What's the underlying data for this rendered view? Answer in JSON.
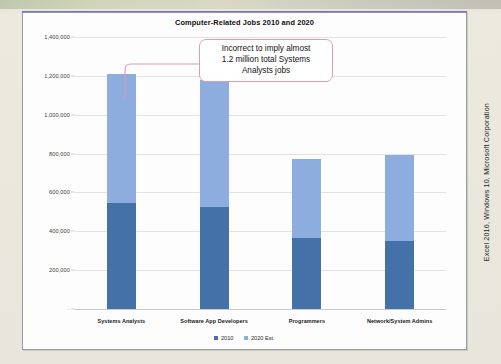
{
  "side_caption": "Excel 2016, Windows 10, Microsoft Corporation",
  "callout": {
    "line1": "Incorrect to imply almost",
    "line2": "1.2 million total Systems",
    "line3": "Analysts jobs",
    "border_color": "#e09bb0"
  },
  "legend": {
    "position": "bottom-center",
    "items": [
      {
        "label": "2010",
        "color": "#4472a8"
      },
      {
        "label": "2020 Est.",
        "color": "#8eaddf"
      }
    ]
  },
  "chart_data": {
    "type": "bar",
    "stacked": true,
    "title": "Computer-Related Jobs 2010 and 2020",
    "xlabel": "",
    "ylabel": "",
    "ylim": [
      0,
      1400000
    ],
    "ytick_values": [
      0,
      200000,
      400000,
      600000,
      800000,
      1000000,
      1200000,
      1400000
    ],
    "ytick_labels": [
      "-",
      "200,000",
      "400,000",
      "600,000",
      "800,000",
      "1,000,000",
      "1,200,000",
      "1,400,000"
    ],
    "grid": true,
    "categories": [
      "Systems Analysts",
      "Software App Developers",
      "Programmers",
      "Network/System Admins"
    ],
    "series": [
      {
        "name": "2010",
        "color": "#4472a8",
        "values": [
          545000,
          525000,
          365000,
          350000
        ]
      },
      {
        "name": "2020 Est.",
        "color": "#8eaddf",
        "values": [
          665000,
          655000,
          405000,
          445000
        ]
      }
    ],
    "totals": [
      1210000,
      1180000,
      770000,
      795000
    ]
  }
}
